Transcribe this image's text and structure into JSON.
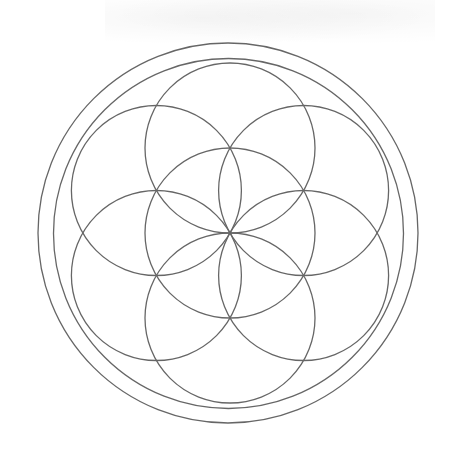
{
  "figure": {
    "stroke_color": "#666666",
    "background": "#ffffff",
    "stroke_width": 1.3,
    "center": [
      230,
      233
    ],
    "outer_rings": [
      {
        "name": "outer-ring",
        "cx": 228,
        "cy": 233,
        "r": 190
      },
      {
        "name": "inner-ring",
        "cx": 228.5,
        "cy": 233.5,
        "r": 175
      }
    ],
    "petal_radius": 85,
    "circles": [
      {
        "name": "center-circle",
        "cx": 230,
        "cy": 233
      },
      {
        "name": "top-circle",
        "cx": 230,
        "cy": 148
      },
      {
        "name": "upper-right-circle",
        "cx": 303.6,
        "cy": 190.5
      },
      {
        "name": "lower-right-circle",
        "cx": 303.6,
        "cy": 275.5
      },
      {
        "name": "bottom-circle",
        "cx": 230,
        "cy": 318
      },
      {
        "name": "lower-left-circle",
        "cx": 156.4,
        "cy": 275.5
      },
      {
        "name": "upper-left-circle",
        "cx": 156.4,
        "cy": 190.5
      }
    ]
  }
}
